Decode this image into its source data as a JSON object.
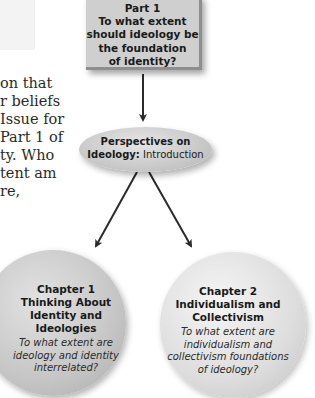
{
  "body_text": {
    "lines": [
      "on that",
      "r beliefs",
      "Issue for",
      " Part 1 of",
      "ty. Who",
      "tent am",
      "re,"
    ]
  },
  "part_box": {
    "label": "Part 1",
    "question_lines": [
      "To what extent",
      "should ideology be",
      "the foundation",
      "of identity?"
    ]
  },
  "intro": {
    "line1": "Perspectives on",
    "line2_bold": "Ideology:",
    "line2_regular": " Introduction"
  },
  "chapters": [
    {
      "title_lines": [
        "Chapter 1",
        "Thinking About",
        "Identity and",
        "Ideologies"
      ],
      "question_lines": [
        "To what extent are",
        "ideology and identity",
        "interrelated?"
      ]
    },
    {
      "title_lines": [
        "Chapter 2",
        "Individualism and",
        "Collectivism"
      ],
      "question_lines": [
        "To what extent are",
        "individualism and",
        "collectivism foundations",
        "of ideology?"
      ]
    }
  ],
  "colors": {
    "box_fill": "#cfcfcf",
    "box_border": "#8e8e8e",
    "arrow": "#2a2a2a",
    "text": "#1a1a1a"
  }
}
